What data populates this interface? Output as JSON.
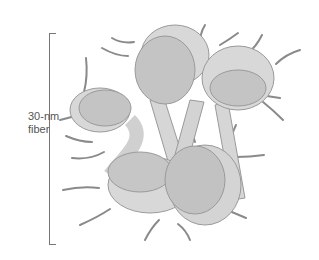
{
  "diagram": {
    "label_line1": "30-nm",
    "label_line2": "fiber",
    "colors": {
      "nucleosome_fill": "#c8c8c8",
      "nucleosome_dark": "#b0b0b0",
      "linker": "#d6d6d6",
      "tail": "#8a8a8a",
      "outline": "#9a9a9a"
    }
  }
}
